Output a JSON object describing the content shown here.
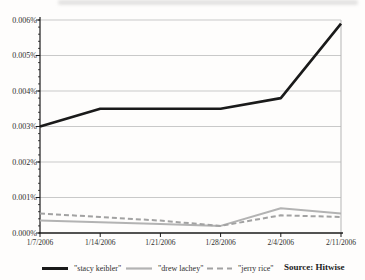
{
  "chart_data": {
    "type": "line",
    "title": "",
    "x_labels": [
      "1/7/2006",
      "1/14/2006",
      "1/21/2006",
      "1/28/2006",
      "2/4/2006",
      "2/11/2006"
    ],
    "y_tick_labels": [
      "0.000%",
      "0.001%",
      "0.002%",
      "0.003%",
      "0.004%",
      "0.005%",
      "0.006%"
    ],
    "ylim": [
      0,
      0.006
    ],
    "y_unit": "%",
    "grid": true,
    "legend_position": "bottom",
    "series": [
      {
        "name": "\"stacy keibler\"",
        "color": "#1a1a1a",
        "style": "solid",
        "stroke_width": 2.6,
        "values": [
          0.003,
          0.0035,
          0.0035,
          0.0035,
          0.0038,
          0.0059
        ]
      },
      {
        "name": "\"drew lachey\"",
        "color": "#b3b3b3",
        "style": "solid",
        "stroke_width": 2,
        "values": [
          0.00035,
          0.0003,
          0.00025,
          0.0002,
          0.0007,
          0.00055
        ]
      },
      {
        "name": "\"jerry rice\"",
        "color": "#a2a2a2",
        "style": "dashed",
        "stroke_width": 2,
        "values": [
          0.00055,
          0.00045,
          0.00035,
          0.0002,
          0.0005,
          0.00045
        ]
      }
    ],
    "source_label": "Source: Hitwise",
    "colors": {
      "axis": "#1a1a1a",
      "gridline": "#c9c9c9",
      "frame": "#b5b5b5",
      "background": "#fefdfc"
    }
  }
}
